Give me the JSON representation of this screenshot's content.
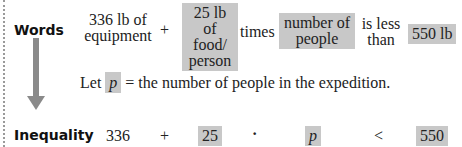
{
  "labels": {
    "words": "Words",
    "inequality": "Inequality"
  },
  "words_row": {
    "equipment_line1": "336 lb of",
    "equipment_line2": "equipment",
    "plus": "+",
    "food_line1": "25 lb of",
    "food_line2": "food/",
    "food_line3": "person",
    "times": "times",
    "people_line1": "number of",
    "people_line2": "people",
    "less_line1": "is less",
    "less_line2": "than",
    "limit": "550 lb"
  },
  "definition": {
    "let": "Let",
    "variable": "p",
    "rest": "= the number of people in the expedition."
  },
  "inequality_row": {
    "term1": "336",
    "plus": "+",
    "term2": "25",
    "dot": "·",
    "variable": "p",
    "relation": "<",
    "limit": "550"
  },
  "colors": {
    "highlight": "#c8c8c8",
    "arrow": "#8a8a8a"
  }
}
